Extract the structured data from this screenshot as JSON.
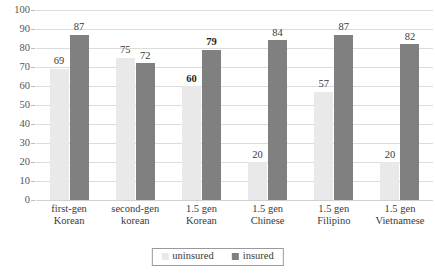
{
  "chart_data": {
    "type": "bar",
    "title": "",
    "subtitle": "",
    "xlabel": "",
    "ylabel": "",
    "ylim": [
      0,
      100
    ],
    "ytick_step": 10,
    "yticks": [
      "100",
      "90",
      "80",
      "70",
      "60",
      "50",
      "40",
      "30",
      "20",
      "10",
      "0"
    ],
    "grid": "horizontal",
    "legend_position": "bottom",
    "categories": [
      "first-gen Korean",
      "second-gen korean",
      "1.5 gen Korean",
      "1.5 gen Chinese",
      "1.5 gen Filipino",
      "1.5 gen Vietnamese"
    ],
    "category_lines": [
      [
        "first-gen",
        "Korean"
      ],
      [
        "second-gen",
        "korean"
      ],
      [
        "1.5 gen",
        "Korean"
      ],
      [
        "1.5 gen",
        "Chinese"
      ],
      [
        "1.5 gen",
        "Filipino"
      ],
      [
        "1.5 gen",
        "Vietnamese"
      ]
    ],
    "series": [
      {
        "name": "uninsured",
        "color": "#e9e9e9",
        "values": [
          69,
          75,
          60,
          20,
          57,
          20
        ],
        "label_bold": [
          false,
          false,
          true,
          false,
          false,
          false
        ]
      },
      {
        "name": "insured",
        "color": "#808080",
        "values": [
          87,
          72,
          79,
          84,
          87,
          82
        ],
        "label_bold": [
          false,
          false,
          true,
          false,
          false,
          false
        ]
      }
    ],
    "legend": [
      {
        "label": "uninsured",
        "color": "#e9e9e9"
      },
      {
        "label": "insured",
        "color": "#808080"
      }
    ]
  }
}
